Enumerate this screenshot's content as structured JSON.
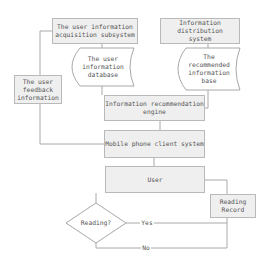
{
  "diagram": {
    "nodes": {
      "acquisition": "The user information\nacquisition subsystem",
      "distribution": "Information distribution\nsystem",
      "user_db": "The user\ninformation\ndatabase",
      "recommended_base": "The\nrecommended\ninformation\nbase",
      "feedback": "The user\nfeedback\ninformation",
      "engine": "Information recommendation\nengine",
      "mobile": "Mobile phone client system",
      "user": "User",
      "reading_record": "Reading\nRecord",
      "decision": "Reading?"
    },
    "edge_labels": {
      "yes": "Yes",
      "no": "No"
    },
    "colors": {
      "box_fill": "#efefef",
      "border": "#b9b9b9",
      "line": "#a8a8a8",
      "text": "#555555"
    }
  }
}
